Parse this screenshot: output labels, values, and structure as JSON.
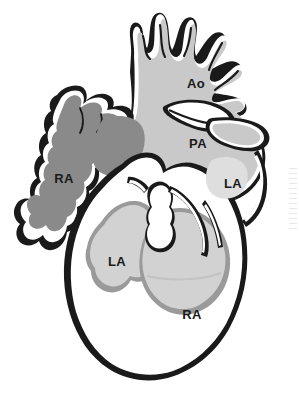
{
  "figure": {
    "name": "heart-anatomy-diagram",
    "kind": "grayscale anatomical line illustration",
    "background_color": "#ffffff"
  },
  "palette": {
    "background": "#ffffff",
    "outline_dark": "#1a1a1a",
    "highlight_white": "#ffffff",
    "fill_dark_gray": "#8a8a8a",
    "fill_mid_gray": "#c9c9c9",
    "fill_light_gray": "#d2d2d2",
    "fill_pale_gray": "#dedede",
    "label_color": "#1a1a1a"
  },
  "labels": [
    {
      "id": "ao",
      "text": "Ao",
      "x": 196,
      "y": 85
    },
    {
      "id": "pa",
      "text": "PA",
      "x": 198,
      "y": 145
    },
    {
      "id": "la-right",
      "text": "LA",
      "x": 233,
      "y": 185
    },
    {
      "id": "ra-left",
      "text": "RA",
      "x": 64,
      "y": 180
    },
    {
      "id": "la-lower",
      "text": "LA",
      "x": 117,
      "y": 263
    },
    {
      "id": "ra-lower",
      "text": "RA",
      "x": 192,
      "y": 316
    }
  ],
  "regions": [
    {
      "id": "right-atrium-dark",
      "label": "RA",
      "shade": "dark-gray"
    },
    {
      "id": "aorta",
      "label": "Ao",
      "shade": "mid-gray"
    },
    {
      "id": "pulmonary-artery",
      "label": "PA",
      "shade": "mid-gray"
    },
    {
      "id": "left-atrium-right",
      "label": "LA",
      "shade": "pale-gray"
    },
    {
      "id": "left-atrium-lower",
      "label": "LA",
      "shade": "light-gray"
    },
    {
      "id": "right-atrium-lower",
      "label": "RA",
      "shade": "light-gray"
    },
    {
      "id": "myocardium",
      "label": "",
      "shade": "white"
    }
  ]
}
